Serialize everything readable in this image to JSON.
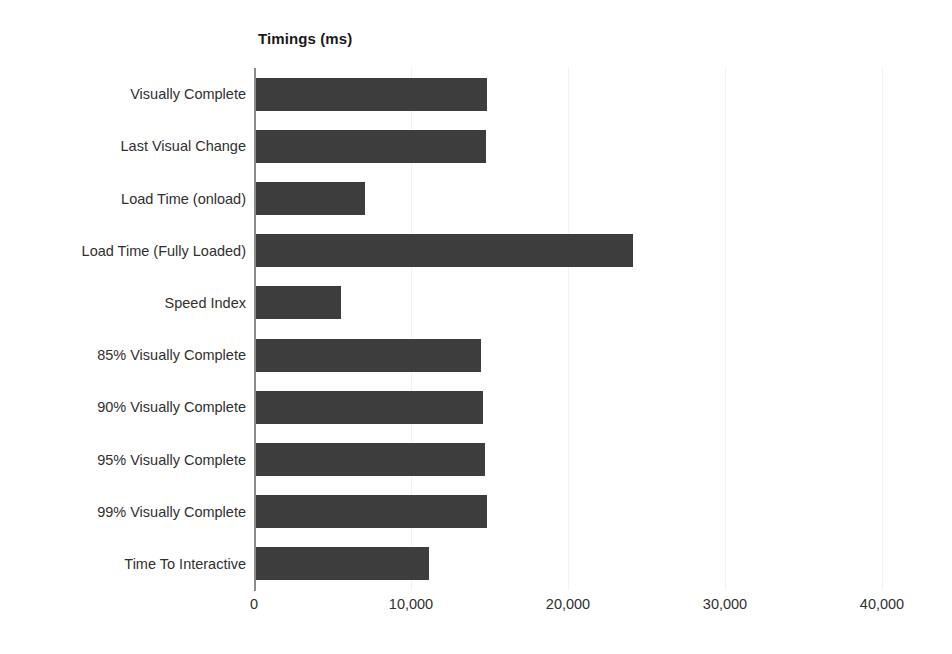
{
  "chart_data": {
    "type": "bar",
    "orientation": "horizontal",
    "title": "Timings (ms)",
    "xlabel": "",
    "ylabel": "",
    "categories": [
      "Visually Complete",
      "Last Visual Change",
      "Load Time (onload)",
      "Load Time (Fully Loaded)",
      "Speed Index",
      "85% Visually Complete",
      "90% Visually Complete",
      "95% Visually Complete",
      "99% Visually Complete",
      "Time To Interactive"
    ],
    "values": [
      14800,
      14700,
      7000,
      24050,
      5450,
      14400,
      14500,
      14650,
      14800,
      11100
    ],
    "xlim": [
      0,
      40000
    ],
    "xticks": [
      0,
      10000,
      20000,
      30000,
      40000
    ],
    "xtick_labels": [
      "0",
      "10,000",
      "20,000",
      "30,000",
      "40,000"
    ],
    "grid": true,
    "grid_axis": "x",
    "legend": false,
    "bar_color": "#3d3d3d",
    "axis_color": "#8c8c8c",
    "grid_color": "#f2f2f2",
    "background": "#ffffff"
  }
}
